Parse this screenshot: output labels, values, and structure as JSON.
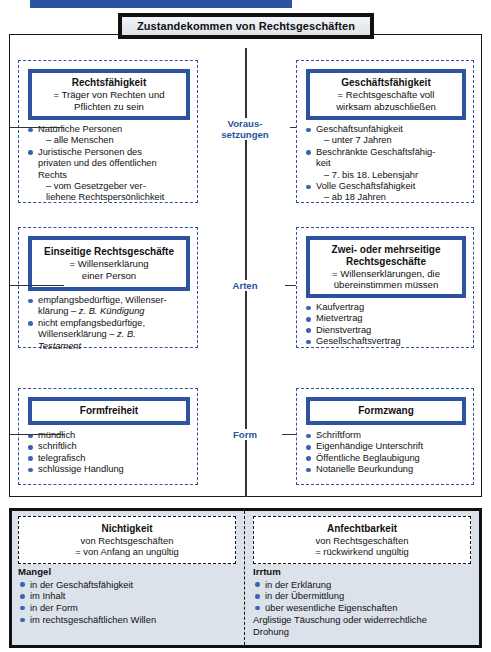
{
  "title": {
    "text": "Zustandekommen von Rechtsgeschäften"
  },
  "connectors": {
    "voraussetzungen_line1": "Voraus-",
    "voraussetzungen_line2": "setzungen",
    "arten": "Arten",
    "form": "Form"
  },
  "rows": [
    {
      "id": "voraussetzungen",
      "left": {
        "head_title": "Rechtsfähigkeit",
        "head_sub_lines": [
          "= Träger von Rechten und",
          "Pflichten zu sein"
        ],
        "items": [
          {
            "type": "bullet",
            "text": "Natürliche Personen"
          },
          {
            "type": "sub",
            "text": "– alle Menschen"
          },
          {
            "type": "bullet",
            "text": "Juristische Personen des"
          },
          {
            "type": "cont",
            "text": "privaten und des öffentlichen"
          },
          {
            "type": "cont",
            "text": "Rechts"
          },
          {
            "type": "sub",
            "text": "– vom Gesetzgeber ver-"
          },
          {
            "type": "sub",
            "text": "liehene Rechtspersönlichkeit"
          }
        ]
      },
      "right": {
        "head_title": "Geschäftsfähigkeit",
        "head_sub_lines": [
          "= Rechtsgeschäfte voll",
          "wirksam abzuschließen"
        ],
        "items": [
          {
            "type": "bullet",
            "text": "Geschäftsunfähigkeit"
          },
          {
            "type": "sub",
            "text": "– unter 7 Jahren"
          },
          {
            "type": "bullet",
            "text": "Beschränkte Geschäftsfähig-"
          },
          {
            "type": "cont",
            "text": "keit"
          },
          {
            "type": "sub",
            "text": "– 7. bis 18. Lebensjahr"
          },
          {
            "type": "bullet",
            "text": "Volle Geschäftsfähigkeit"
          },
          {
            "type": "sub",
            "text": "– ab 18 Jahren"
          }
        ]
      }
    },
    {
      "id": "arten",
      "left": {
        "head_title": "Einseitige Rechtsgeschäfte",
        "head_sub_lines": [
          "= Willenserklärung",
          "einer Person"
        ],
        "items": [
          {
            "type": "bullet",
            "text": "empfangsbedürftige, Willenser-"
          },
          {
            "type": "cont",
            "text": "klärung – ",
            "italic": "z. B. Kündigung"
          },
          {
            "type": "bullet",
            "text": "nicht empfangsbedürftige,"
          },
          {
            "type": "cont",
            "text": "Willenserklärung – ",
            "italic": "z. B."
          },
          {
            "type": "cont",
            "text": "",
            "italic": "Testament"
          }
        ]
      },
      "right": {
        "head_title_lines": [
          "Zwei- oder mehrseitige",
          "Rechtsgeschäfte"
        ],
        "head_sub_lines": [
          "= Willenserklärungen, die",
          "übereinstimmen müssen"
        ],
        "items": [
          {
            "type": "bullet",
            "text": "Kaufvertrag"
          },
          {
            "type": "bullet",
            "text": "Mietvertrag"
          },
          {
            "type": "bullet",
            "text": "Dienstvertrag"
          },
          {
            "type": "bullet",
            "text": "Gesellschaftsvertrag"
          }
        ]
      }
    },
    {
      "id": "form",
      "left": {
        "head_title": "Formfreiheit",
        "items": [
          {
            "type": "bullet",
            "text": "mündlich"
          },
          {
            "type": "bullet",
            "text": "schriftlich"
          },
          {
            "type": "bullet",
            "text": "telegrafisch"
          },
          {
            "type": "bullet",
            "text": "schlüssige Handlung"
          }
        ]
      },
      "right": {
        "head_title": "Formzwang",
        "items": [
          {
            "type": "bullet",
            "text": "Schriftform"
          },
          {
            "type": "bullet",
            "text": "Eigenhändige Unterschrift"
          },
          {
            "type": "bullet",
            "text": "Öffentliche Beglaubigung"
          },
          {
            "type": "bullet",
            "text": "Notarielle Beurkundung"
          }
        ]
      }
    }
  ],
  "bottom": {
    "left": {
      "head_title": "Nichtigkeit",
      "head_sub_lines": [
        "von Rechtsgeschäften",
        "= von Anfang an ungültig"
      ],
      "category": "Mangel",
      "items": [
        {
          "type": "bullet",
          "text": "in der Geschäftsfähigkeit"
        },
        {
          "type": "bullet",
          "text": "im Inhalt"
        },
        {
          "type": "bullet",
          "text": "in der Form"
        },
        {
          "type": "bullet",
          "text": "im rechtsgeschäftlichen Willen"
        }
      ]
    },
    "right": {
      "head_title": "Anfechtbarkeit",
      "head_sub_lines": [
        "von Rechtsgeschäften",
        "= rückwirkend ungültig"
      ],
      "category": "Irrtum",
      "items": [
        {
          "type": "bullet",
          "text": "in der Erklärung"
        },
        {
          "type": "bullet",
          "text": "in der Übermittlung"
        },
        {
          "type": "bullet",
          "text": "über wesentliche Eigenschaften"
        },
        {
          "type": "plain",
          "text": "Arglistige Täuschung oder widerrechtliche"
        },
        {
          "type": "plain",
          "text": "Drohung"
        }
      ]
    }
  },
  "colors": {
    "accent_blue": "#2c52a0",
    "bullet_blue": "#3a62b5",
    "frame_black": "#111111",
    "bottom_bg": "#dbe2ea"
  }
}
